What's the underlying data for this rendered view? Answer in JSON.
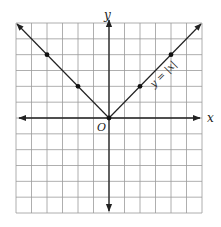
{
  "chart_data": {
    "type": "line",
    "title": "",
    "xlabel": "x",
    "ylabel": "y",
    "origin_label": "O",
    "xlim": [
      -6,
      6
    ],
    "ylim": [
      -6,
      6
    ],
    "grid": true,
    "tick_labels": false,
    "series": [
      {
        "name": "y = |x|",
        "equation": "y = |x|",
        "x": [
          -6,
          -4,
          -2,
          0,
          2,
          4,
          6
        ],
        "y": [
          6,
          4,
          2,
          0,
          2,
          4,
          6
        ],
        "marked_points": [
          [
            -4,
            4
          ],
          [
            -2,
            2
          ],
          [
            0,
            0
          ],
          [
            2,
            2
          ],
          [
            4,
            4
          ]
        ],
        "arrows_at_ends": true
      }
    ],
    "annotations": [
      {
        "text": "y = |x|",
        "near": [
          3,
          2.5
        ],
        "rotation_deg": -45
      }
    ]
  },
  "labels": {
    "x_axis": "x",
    "y_axis": "y",
    "origin": "O",
    "equation": "y = |x|"
  },
  "colors": {
    "grid": "#9a9a9a",
    "axis": "#222222",
    "curve": "#222222"
  }
}
